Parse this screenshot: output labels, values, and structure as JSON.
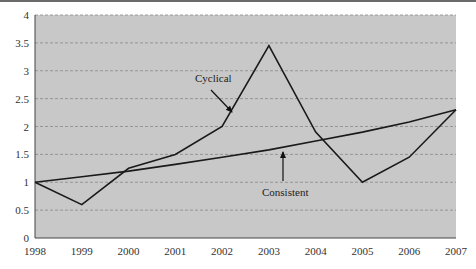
{
  "chart_data": {
    "type": "line",
    "title": "",
    "xlabel": "",
    "ylabel": "",
    "categories": [
      "1998",
      "1999",
      "2000",
      "2001",
      "2002",
      "2003",
      "2004",
      "2005",
      "2006",
      "2007"
    ],
    "series": [
      {
        "name": "Cyclical",
        "values": [
          1.0,
          0.6,
          1.25,
          1.5,
          2.0,
          3.45,
          1.9,
          1.0,
          1.45,
          2.3
        ]
      },
      {
        "name": "Consistent",
        "values": [
          1.0,
          1.1,
          1.2,
          1.32,
          1.45,
          1.58,
          1.74,
          1.9,
          2.08,
          2.3
        ]
      }
    ],
    "ylim": [
      0,
      4
    ],
    "yticks": [
      "0",
      "0.5",
      "1",
      "1.5",
      "2",
      "2.5",
      "3",
      "3.5",
      "4"
    ],
    "grid": "horizontal dashed",
    "legend": "none (inline annotations with arrows)",
    "annotations": [
      {
        "text": "Cyclical",
        "points_to": "Cyclical line near 2002-2003"
      },
      {
        "text": "Consistent",
        "points_to": "Consistent line near 2003-2004"
      }
    ],
    "colors": {
      "plot_bg": "#c8c8c8",
      "line": "#1a1a1a",
      "grid": "#888888"
    }
  }
}
